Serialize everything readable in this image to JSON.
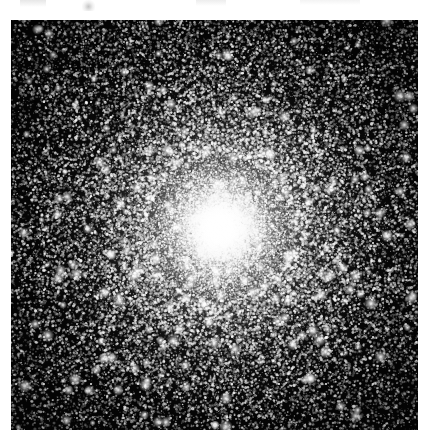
{
  "page": {
    "background_color": "#ffffff",
    "width": 435,
    "height": 444,
    "caption": ""
  },
  "plate": {
    "name": "globular-cluster-photograph",
    "description": "Grayscale astronomical photographic plate of a dense globular star cluster",
    "frame": {
      "x": 11,
      "y": 20,
      "width": 407,
      "height": 410
    },
    "background_color": "#050505",
    "star_color": "#ffffff",
    "core": {
      "center_x_pct": 51.3,
      "center_y_pct": 50.7,
      "peak_color": "#ffffff",
      "saturated_radius_px": 44,
      "halo_radius_px": 250
    },
    "notable_stars": [
      {
        "name": "bright-star-lower-center",
        "x_pct": 50.1,
        "y_pct": 98.8,
        "size_px": 7.5,
        "brightness": 1.0
      },
      {
        "name": "bright-star-upper-right",
        "x_pct": 82.6,
        "y_pct": 6.8,
        "size_px": 4.6,
        "brightness": 0.92
      },
      {
        "name": "bright-star-upper-left",
        "x_pct": 29.5,
        "y_pct": 5.1,
        "size_px": 4.2,
        "brightness": 0.9
      },
      {
        "name": "bright-star-left-mid",
        "x_pct": 5.2,
        "y_pct": 44.0,
        "size_px": 3.9,
        "brightness": 0.86
      },
      {
        "name": "bright-star-right-mid",
        "x_pct": 95.0,
        "y_pct": 52.4,
        "size_px": 4.0,
        "brightness": 0.88
      },
      {
        "name": "bright-star-lower-left",
        "x_pct": 12.8,
        "y_pct": 88.0,
        "size_px": 4.1,
        "brightness": 0.87
      },
      {
        "name": "bright-star-lower-right",
        "x_pct": 88.3,
        "y_pct": 82.5,
        "size_px": 3.8,
        "brightness": 0.85
      },
      {
        "name": "bright-star-top-center",
        "x_pct": 56.4,
        "y_pct": 2.6,
        "size_px": 3.6,
        "brightness": 0.84
      },
      {
        "name": "bright-star-upper-midleft",
        "x_pct": 18.6,
        "y_pct": 20.2,
        "size_px": 3.4,
        "brightness": 0.82
      },
      {
        "name": "bright-star-rightedge",
        "x_pct": 97.2,
        "y_pct": 27.5,
        "size_px": 3.3,
        "brightness": 0.8
      },
      {
        "name": "bright-star-bottom-right",
        "x_pct": 76.0,
        "y_pct": 95.2,
        "size_px": 3.5,
        "brightness": 0.83
      },
      {
        "name": "bright-star-leftedge-low",
        "x_pct": 3.1,
        "y_pct": 70.6,
        "size_px": 3.2,
        "brightness": 0.8
      },
      {
        "name": "bright-star-outer-ne",
        "x_pct": 70.4,
        "y_pct": 13.9,
        "size_px": 3.1,
        "brightness": 0.78
      },
      {
        "name": "bright-star-outer-sw",
        "x_pct": 26.2,
        "y_pct": 78.9,
        "size_px": 3.0,
        "brightness": 0.78
      },
      {
        "name": "bright-star-outer-nw",
        "x_pct": 9.8,
        "y_pct": 14.3,
        "size_px": 2.9,
        "brightness": 0.76
      },
      {
        "name": "bright-star-outer-se",
        "x_pct": 92.7,
        "y_pct": 90.1,
        "size_px": 3.0,
        "brightness": 0.77
      },
      {
        "name": "bright-star-mid-upper",
        "x_pct": 44.0,
        "y_pct": 24.7,
        "size_px": 2.8,
        "brightness": 0.75
      },
      {
        "name": "bright-star-mid-lower",
        "x_pct": 61.2,
        "y_pct": 76.3,
        "size_px": 2.8,
        "brightness": 0.75
      },
      {
        "name": "bright-star-far-left",
        "x_pct": 2.0,
        "y_pct": 31.8,
        "size_px": 2.7,
        "brightness": 0.74
      },
      {
        "name": "bright-star-far-bottom",
        "x_pct": 34.5,
        "y_pct": 97.0,
        "size_px": 2.9,
        "brightness": 0.76
      },
      {
        "name": "bright-star-ne-corner",
        "x_pct": 93.4,
        "y_pct": 3.6,
        "size_px": 2.6,
        "brightness": 0.72
      },
      {
        "name": "bright-star-sw-corner",
        "x_pct": 6.4,
        "y_pct": 94.4,
        "size_px": 2.6,
        "brightness": 0.72
      },
      {
        "name": "bright-star-north",
        "x_pct": 38.9,
        "y_pct": 8.9,
        "size_px": 2.7,
        "brightness": 0.73
      },
      {
        "name": "bright-star-east",
        "x_pct": 86.1,
        "y_pct": 40.2,
        "size_px": 2.7,
        "brightness": 0.74
      },
      {
        "name": "bright-star-west",
        "x_pct": 14.9,
        "y_pct": 56.1,
        "size_px": 2.6,
        "brightness": 0.73
      },
      {
        "name": "bright-star-south",
        "x_pct": 55.8,
        "y_pct": 89.6,
        "size_px": 2.7,
        "brightness": 0.74
      }
    ]
  },
  "artifacts": {
    "top_margin_smudges": [
      {
        "name": "scan-smudge-left",
        "x": 20,
        "y": 0,
        "width": 26,
        "height": 7
      },
      {
        "name": "scan-smudge-hook",
        "x": 82,
        "y": 0,
        "width": 13,
        "height": 11
      },
      {
        "name": "scan-smudge-center",
        "x": 196,
        "y": 0,
        "width": 30,
        "height": 6
      },
      {
        "name": "scan-smudge-right",
        "x": 300,
        "y": 0,
        "width": 60,
        "height": 5
      }
    ]
  }
}
